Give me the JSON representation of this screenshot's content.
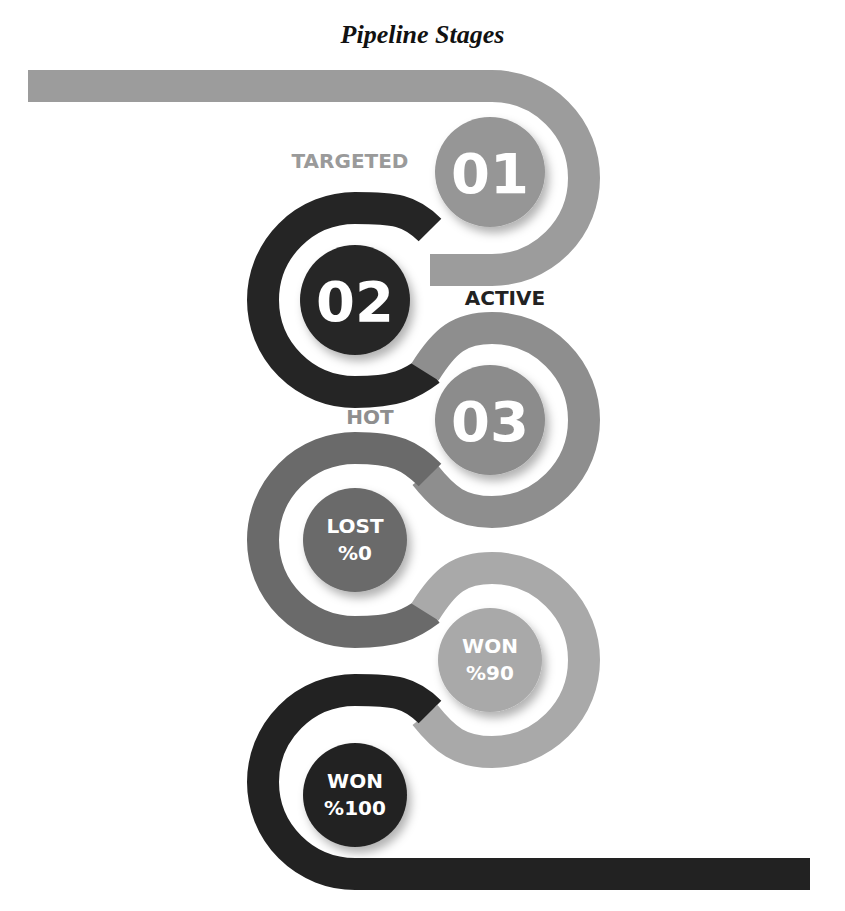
{
  "title": "Pipeline Stages",
  "colors": {
    "light_gray": "#9a9a9a",
    "mid_gray": "#8a8a8a",
    "dark": "#2a2a2a",
    "darker": "#1e1e1e",
    "lost": "#6e6e6e",
    "won90": "#a8a8a8"
  },
  "stages": [
    {
      "number": "01",
      "label": "TARGETED"
    },
    {
      "number": "02",
      "label": "ACTIVE"
    },
    {
      "number": "03",
      "label": "HOT"
    },
    {
      "line1": "LOST",
      "line2": "%0"
    },
    {
      "line1": "WON",
      "line2": "%90"
    },
    {
      "line1": "WON",
      "line2": "%100"
    }
  ]
}
